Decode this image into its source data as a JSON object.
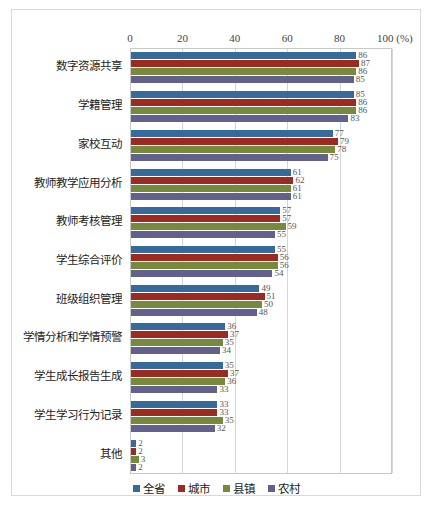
{
  "chart_data": {
    "type": "bar",
    "orientation": "horizontal",
    "title": "",
    "subtitle": "",
    "xlabel": "(%)",
    "ylabel": "",
    "xlim": [
      0,
      100
    ],
    "xticks": [
      0,
      20,
      40,
      60,
      80,
      100
    ],
    "xtick_labels": [
      "0",
      "20",
      "40",
      "60",
      "80",
      "100 (%)"
    ],
    "grid": true,
    "grid_axis": "x",
    "legend_position": "bottom",
    "categories": [
      "数字资源共享",
      "学籍管理",
      "家校互动",
      "教师教学应用分析",
      "教师考核管理",
      "学生综合评价",
      "班级组织管理",
      "学情分析和学情预警",
      "学生成长报告生成",
      "学生学习行为记录",
      "其他"
    ],
    "series": [
      {
        "name": "全省",
        "color": "#356A9B",
        "values": [
          86,
          85,
          77,
          61,
          57,
          55,
          49,
          36,
          35,
          33,
          2
        ]
      },
      {
        "name": "城市",
        "color": "#9C2A20",
        "values": [
          87,
          86,
          79,
          62,
          57,
          56,
          51,
          37,
          37,
          33,
          2
        ]
      },
      {
        "name": "县镇",
        "color": "#76893C",
        "values": [
          86,
          86,
          78,
          61,
          59,
          56,
          50,
          35,
          36,
          35,
          3
        ]
      },
      {
        "name": "农村",
        "color": "#61618C",
        "values": [
          85,
          83,
          75,
          61,
          55,
          54,
          48,
          34,
          33,
          32,
          2
        ]
      }
    ]
  },
  "legend": {
    "items": [
      {
        "label": "全省",
        "color": "#356A9B"
      },
      {
        "label": "城市",
        "color": "#9C2A20"
      },
      {
        "label": "县镇",
        "color": "#76893C"
      },
      {
        "label": "农村",
        "color": "#61618C"
      }
    ]
  }
}
